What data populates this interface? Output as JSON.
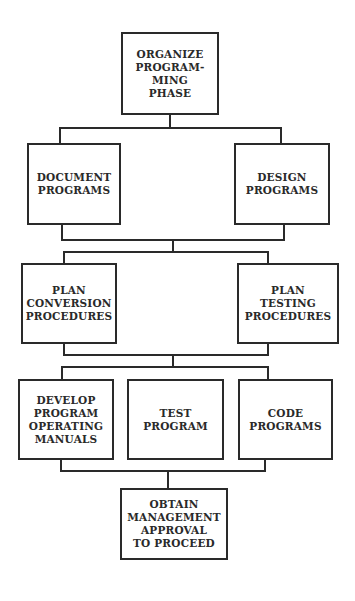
{
  "diagram": {
    "type": "flowchart",
    "nodes": {
      "organize": "ORGANIZE\nPROGRAM-\nMING\nPHASE",
      "document": "DOCUMENT\nPROGRAMS",
      "design": "DESIGN\nPROGRAMS",
      "plan_conversion": "PLAN\nCONVERSION\nPROCEDURES",
      "plan_testing": "PLAN\nTESTING\nPROCEDURES",
      "develop_manuals": "DEVELOP\nPROGRAM\nOPERATING\nMANUALS",
      "test_program": "TEST\nPROGRAM",
      "code_programs": "CODE\nPROGRAMS",
      "obtain_approval": "OBTAIN\nMANAGEMENT\nAPPROVAL\nTO PROCEED"
    },
    "edges": [
      [
        "organize",
        "document"
      ],
      [
        "organize",
        "design"
      ],
      [
        "document",
        "plan_conversion"
      ],
      [
        "design",
        "plan_conversion"
      ],
      [
        "document",
        "plan_testing"
      ],
      [
        "design",
        "plan_testing"
      ],
      [
        "plan_conversion",
        "develop_manuals"
      ],
      [
        "plan_conversion",
        "test_program"
      ],
      [
        "plan_conversion",
        "code_programs"
      ],
      [
        "plan_testing",
        "develop_manuals"
      ],
      [
        "plan_testing",
        "test_program"
      ],
      [
        "plan_testing",
        "code_programs"
      ],
      [
        "develop_manuals",
        "obtain_approval"
      ],
      [
        "test_program",
        "obtain_approval"
      ],
      [
        "code_programs",
        "obtain_approval"
      ]
    ],
    "colors": {
      "line": "#2a2a2a",
      "background": "#ffffff"
    }
  }
}
